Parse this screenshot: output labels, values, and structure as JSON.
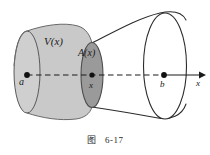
{
  "figure": {
    "caption_prefix": "图",
    "caption_number": "6-17",
    "labels": {
      "volume_function": "V(x)",
      "area_function": "A(x)",
      "left_endpoint": "a",
      "cross_section_point": "x",
      "right_endpoint": "b",
      "axis": "x"
    },
    "colors": {
      "body_fill": "#c9c9c9",
      "cross_section_fill": "#9a9a9a",
      "left_cap_fill": "#cfcfcf",
      "outline": "#2b2b2b",
      "axis": "#1a1a1a",
      "background": "#ffffff"
    },
    "geometry": {
      "axis_y": 75,
      "point_a_x": 27,
      "point_x_x": 92,
      "point_b_x": 164,
      "arrow_tip_x": 203,
      "solid_left_x": 14,
      "solid_right_x": 186
    }
  }
}
